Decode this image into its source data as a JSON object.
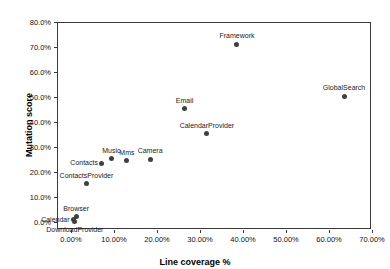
{
  "chart_data": {
    "type": "scatter",
    "title": "",
    "xlabel": "Line coverage %",
    "ylabel": "Mutation score",
    "xlim": [
      0,
      70
    ],
    "ylim": [
      0,
      80
    ],
    "xticks": [
      "0.00%",
      "10.00%",
      "20.00%",
      "30.00%",
      "40.00%",
      "50.00%",
      "60.00%",
      "70.00%"
    ],
    "xtick_values": [
      0,
      10,
      20,
      30,
      40,
      50,
      60,
      70
    ],
    "yticks": [
      "0.0%",
      "10.0%",
      "20.0%",
      "30.0%",
      "40.0%",
      "50.0%",
      "60.0%",
      "70.0%",
      "80.0%"
    ],
    "ytick_values": [
      0,
      10,
      20,
      30,
      40,
      50,
      60,
      70,
      80
    ],
    "grid": false,
    "legend": false,
    "marker_color": "#404040",
    "points": [
      {
        "label": "Framework",
        "x": 38.6,
        "y": 71.2,
        "label_pos": "above"
      },
      {
        "label": "GlobalSearch",
        "x": 63.5,
        "y": 50.4,
        "label_pos": "above"
      },
      {
        "label": "Email",
        "x": 26.4,
        "y": 45.4,
        "label_pos": "above"
      },
      {
        "label": "CalendarProvider",
        "x": 31.6,
        "y": 35.4,
        "label_pos": "above"
      },
      {
        "label": "Camera",
        "x": 18.4,
        "y": 25.2,
        "label_pos": "above"
      },
      {
        "label": "Mms",
        "x": 13.0,
        "y": 24.6,
        "label_pos": "above"
      },
      {
        "label": "Music",
        "x": 9.4,
        "y": 25.4,
        "label_pos": "above"
      },
      {
        "label": "Contacts",
        "x": 7.2,
        "y": 23.6,
        "label_pos": "left"
      },
      {
        "label": "ContactsProvider",
        "x": 3.6,
        "y": 15.4,
        "label_pos": "above"
      },
      {
        "label": "Browser",
        "x": 1.2,
        "y": 2.2,
        "label_pos": "above"
      },
      {
        "label": "Calendar",
        "x": 0.6,
        "y": 1.0,
        "label_pos": "left"
      },
      {
        "label": "DownloadProvider",
        "x": 0.9,
        "y": 0.2,
        "label_pos": "below"
      }
    ]
  },
  "axes": {
    "x_title": "Line coverage %",
    "y_title": "Mutation score"
  }
}
